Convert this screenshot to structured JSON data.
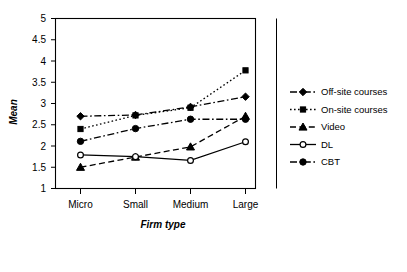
{
  "chart_data": {
    "type": "line",
    "title": "",
    "xlabel": "Firm type",
    "ylabel": "Mean",
    "categories": [
      "Micro",
      "Small",
      "Medium",
      "Large"
    ],
    "ylim": [
      1,
      5
    ],
    "yticks": [
      "1",
      "1.5",
      "2",
      "2.5",
      "3",
      "3.5",
      "4",
      "4.5",
      "5"
    ],
    "ytick_values": [
      1,
      1.5,
      2,
      2.5,
      3,
      3.5,
      4,
      4.5,
      5
    ],
    "grid": false,
    "legend_position": "right",
    "series": [
      {
        "name": "Off-site courses",
        "values": [
          2.7,
          2.73,
          2.92,
          3.16
        ],
        "marker": "diamond",
        "line_style": "dash-dot",
        "color": "#000000"
      },
      {
        "name": "On-site courses",
        "values": [
          2.4,
          2.72,
          2.9,
          3.78
        ],
        "marker": "square",
        "line_style": "dotted",
        "color": "#000000"
      },
      {
        "name": "Video",
        "values": [
          1.5,
          1.74,
          1.98,
          2.7
        ],
        "marker": "triangle",
        "line_style": "dashed",
        "color": "#000000"
      },
      {
        "name": "DL",
        "values": [
          1.79,
          1.75,
          1.66,
          2.1
        ],
        "marker": "circle-open",
        "line_style": "solid",
        "color": "#000000"
      },
      {
        "name": "CBT",
        "values": [
          2.11,
          2.41,
          2.63,
          2.63
        ],
        "marker": "circle-filled",
        "line_style": "dash-dot",
        "color": "#000000"
      }
    ]
  },
  "legend": {
    "items": [
      {
        "label": "Off-site courses",
        "marker_name": "diamond-marker-icon"
      },
      {
        "label": "On-site courses",
        "marker_name": "square-marker-icon"
      },
      {
        "label": "Video",
        "marker_name": "triangle-marker-icon"
      },
      {
        "label": "DL",
        "marker_name": "open-circle-marker-icon"
      },
      {
        "label": "CBT",
        "marker_name": "filled-circle-marker-icon"
      }
    ]
  },
  "axes": {
    "y_title": "Mean",
    "x_title": "Firm type"
  }
}
